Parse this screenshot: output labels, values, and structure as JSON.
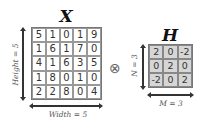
{
  "input_matrix": {
    "title": "X",
    "rows": [
      [
        "5",
        "1",
        "0",
        "1",
        "9"
      ],
      [
        "1",
        "6",
        "1",
        "7",
        "0"
      ],
      [
        "4",
        "1",
        "6",
        "3",
        "5"
      ],
      [
        "1",
        "8",
        "0",
        "1",
        "0"
      ],
      [
        "2",
        "2",
        "8",
        "0",
        "4"
      ]
    ],
    "height_label": "Height = 5",
    "width_label": "Width = 5"
  },
  "operator": {
    "symbol": "⊗",
    "icon": "convolution-operator-icon"
  },
  "kernel_matrix": {
    "title": "H",
    "rows": [
      [
        "2",
        "0",
        "-2"
      ],
      [
        "0",
        "2",
        "0"
      ],
      [
        "-2",
        "0",
        "2"
      ]
    ],
    "height_label": "N = 3",
    "width_label": "M = 3",
    "fill_color": "#d6d6d6"
  }
}
